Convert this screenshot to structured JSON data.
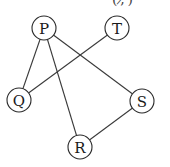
{
  "header_fragment": "( , ̸)",
  "nodes": [
    {
      "id": "P",
      "label": "P",
      "x": 44,
      "y": 28
    },
    {
      "id": "T",
      "label": "T",
      "x": 117,
      "y": 28
    },
    {
      "id": "Q",
      "label": "Q",
      "x": 19,
      "y": 100
    },
    {
      "id": "S",
      "label": "S",
      "x": 142,
      "y": 101
    },
    {
      "id": "R",
      "label": "R",
      "x": 80,
      "y": 147
    }
  ],
  "edges": [
    [
      "P",
      "Q"
    ],
    [
      "P",
      "R"
    ],
    [
      "P",
      "S"
    ],
    [
      "T",
      "Q"
    ],
    [
      "R",
      "S"
    ]
  ],
  "node_radius": 12
}
